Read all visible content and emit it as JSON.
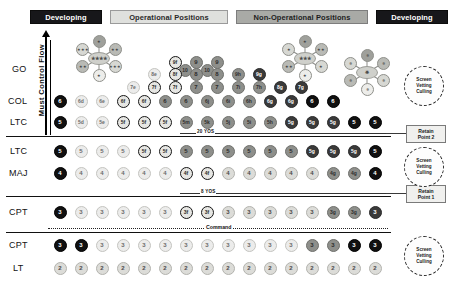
{
  "header": {
    "banners": [
      {
        "label": "Developing",
        "style": "dark"
      },
      {
        "label": "Operational Positions",
        "style": "light"
      },
      {
        "label": "Non-Operational Positions",
        "style": "mid"
      },
      {
        "label": "Developing",
        "style": "dark"
      }
    ]
  },
  "axis": {
    "label": "Must Control Flow"
  },
  "rank_labels": {
    "go": "GO",
    "col": "COL",
    "ltc_above": "LTC",
    "ltc_below": "LTC",
    "maj": "MAJ",
    "cpt_above": "CPT",
    "cpt_below": "CPT",
    "lt": "LT"
  },
  "dividers": {
    "yos20": "20 YOS",
    "yos8": "8 YOS",
    "command": "Command"
  },
  "annotations": {
    "retain_point_2": {
      "line1": "Retain",
      "line2": "Point 2"
    },
    "retain_point_1": {
      "line1": "Retain",
      "line2": "Point 1"
    },
    "screen_vetting_culling": {
      "line1": "Screen",
      "line2": "Vetting",
      "line3": "Culling"
    }
  },
  "clusters": [
    {
      "name": "four-star-cluster",
      "hub": "★★★★",
      "spokes": [
        "★",
        "★★",
        "★★★",
        "★",
        "★★",
        "★★★"
      ]
    },
    {
      "name": "three-star-cluster",
      "hub": "★★★",
      "spokes": [
        "★",
        "★★",
        "★",
        "★",
        "★★",
        "★"
      ]
    },
    {
      "name": "eagle-cluster",
      "hub": "✵",
      "spokes": [
        "✵",
        "✵",
        "✵",
        "✵",
        "✵",
        "✵"
      ]
    }
  ],
  "chart_data": {
    "type": "diagram",
    "rows": [
      {
        "rank": "GO",
        "y": 70,
        "nodes": [
          {
            "x": 185,
            "label": "10",
            "tone": "mid"
          },
          {
            "x": 207,
            "label": "10",
            "tone": "mid"
          },
          {
            "x": 175,
            "label": "9f",
            "tone": "ring",
            "y": 62
          },
          {
            "x": 196,
            "label": "9",
            "tone": "mid",
            "y": 62
          },
          {
            "x": 217,
            "label": "9",
            "tone": "mid",
            "y": 62
          },
          {
            "x": 154,
            "label": "8e",
            "tone": "vlight",
            "y": 74
          },
          {
            "x": 175,
            "label": "8f",
            "tone": "ring",
            "y": 74
          },
          {
            "x": 196,
            "label": "8",
            "tone": "mid",
            "y": 74
          },
          {
            "x": 217,
            "label": "8",
            "tone": "mid",
            "y": 74
          },
          {
            "x": 238,
            "label": "9h",
            "tone": "mid",
            "y": 74
          },
          {
            "x": 259,
            "label": "9g",
            "tone": "dark",
            "y": 74
          },
          {
            "x": 133,
            "label": "7e",
            "tone": "vlight",
            "y": 87
          },
          {
            "x": 154,
            "label": "7f",
            "tone": "ring",
            "y": 87
          },
          {
            "x": 175,
            "label": "7f",
            "tone": "ring",
            "y": 87
          },
          {
            "x": 196,
            "label": "7",
            "tone": "mid",
            "y": 87
          },
          {
            "x": 217,
            "label": "7",
            "tone": "mid",
            "y": 87
          },
          {
            "x": 238,
            "label": "7i",
            "tone": "mid",
            "y": 87
          },
          {
            "x": 259,
            "label": "7h",
            "tone": "mid",
            "y": 87
          },
          {
            "x": 280,
            "label": "8g",
            "tone": "dark",
            "y": 87
          },
          {
            "x": 301,
            "label": "7g",
            "tone": "dark",
            "y": 87
          }
        ]
      },
      {
        "rank": "COL",
        "y": 101,
        "nodes": [
          {
            "x": 60,
            "label": "6",
            "tone": "black"
          },
          {
            "x": 81,
            "label": "6d",
            "tone": "vlight"
          },
          {
            "x": 102,
            "label": "6e",
            "tone": "vlight"
          },
          {
            "x": 123,
            "label": "6f",
            "tone": "ring"
          },
          {
            "x": 144,
            "label": "6f",
            "tone": "ring"
          },
          {
            "x": 165,
            "label": "6",
            "tone": "mid"
          },
          {
            "x": 186,
            "label": "6",
            "tone": "mid"
          },
          {
            "x": 207,
            "label": "6j",
            "tone": "mid"
          },
          {
            "x": 228,
            "label": "6i",
            "tone": "mid"
          },
          {
            "x": 249,
            "label": "6h",
            "tone": "mid"
          },
          {
            "x": 270,
            "label": "6g",
            "tone": "dark"
          },
          {
            "x": 291,
            "label": "6g",
            "tone": "dark"
          },
          {
            "x": 312,
            "label": "6",
            "tone": "black"
          },
          {
            "x": 333,
            "label": "6",
            "tone": "black"
          }
        ]
      },
      {
        "rank": "LTC",
        "y": 122,
        "nodes": [
          {
            "x": 60,
            "label": "5",
            "tone": "black"
          },
          {
            "x": 81,
            "label": "5d",
            "tone": "vlight"
          },
          {
            "x": 102,
            "label": "5e",
            "tone": "vlight"
          },
          {
            "x": 123,
            "label": "5f",
            "tone": "ring"
          },
          {
            "x": 144,
            "label": "5f",
            "tone": "ring"
          },
          {
            "x": 165,
            "label": "5f",
            "tone": "ring"
          },
          {
            "x": 186,
            "label": "5m",
            "tone": "mid"
          },
          {
            "x": 207,
            "label": "5k",
            "tone": "mid"
          },
          {
            "x": 228,
            "label": "5j",
            "tone": "mid"
          },
          {
            "x": 249,
            "label": "5i",
            "tone": "mid"
          },
          {
            "x": 270,
            "label": "5h",
            "tone": "mid"
          },
          {
            "x": 291,
            "label": "5g",
            "tone": "dark"
          },
          {
            "x": 312,
            "label": "5g",
            "tone": "dark"
          },
          {
            "x": 333,
            "label": "5g",
            "tone": "dark"
          },
          {
            "x": 354,
            "label": "5",
            "tone": "black"
          },
          {
            "x": 375,
            "label": "5",
            "tone": "black"
          }
        ]
      },
      {
        "rank": "LTC",
        "y": 151,
        "nodes": [
          {
            "x": 60,
            "label": "5",
            "tone": "black"
          },
          {
            "x": 81,
            "label": "5",
            "tone": "vlight"
          },
          {
            "x": 102,
            "label": "5",
            "tone": "vlight"
          },
          {
            "x": 123,
            "label": "5",
            "tone": "vlight"
          },
          {
            "x": 144,
            "label": "5f",
            "tone": "ring"
          },
          {
            "x": 165,
            "label": "5f",
            "tone": "ring"
          },
          {
            "x": 186,
            "label": "5",
            "tone": "mid"
          },
          {
            "x": 207,
            "label": "5",
            "tone": "mid"
          },
          {
            "x": 228,
            "label": "5",
            "tone": "mid"
          },
          {
            "x": 249,
            "label": "5",
            "tone": "mid"
          },
          {
            "x": 270,
            "label": "5",
            "tone": "mid"
          },
          {
            "x": 291,
            "label": "5",
            "tone": "mid"
          },
          {
            "x": 312,
            "label": "5g",
            "tone": "dark"
          },
          {
            "x": 333,
            "label": "5g",
            "tone": "dark"
          },
          {
            "x": 354,
            "label": "5g",
            "tone": "dark"
          },
          {
            "x": 375,
            "label": "5",
            "tone": "black"
          }
        ]
      },
      {
        "rank": "MAJ",
        "y": 173,
        "nodes": [
          {
            "x": 60,
            "label": "4",
            "tone": "black"
          },
          {
            "x": 81,
            "label": "4",
            "tone": "vlight"
          },
          {
            "x": 102,
            "label": "4",
            "tone": "vlight"
          },
          {
            "x": 123,
            "label": "4",
            "tone": "vlight"
          },
          {
            "x": 144,
            "label": "4",
            "tone": "vlight"
          },
          {
            "x": 165,
            "label": "4",
            "tone": "vlight"
          },
          {
            "x": 186,
            "label": "4f",
            "tone": "ring"
          },
          {
            "x": 207,
            "label": "4f",
            "tone": "ring"
          },
          {
            "x": 228,
            "label": "4",
            "tone": "light"
          },
          {
            "x": 249,
            "label": "4",
            "tone": "light"
          },
          {
            "x": 270,
            "label": "4",
            "tone": "light"
          },
          {
            "x": 291,
            "label": "4",
            "tone": "light"
          },
          {
            "x": 312,
            "label": "4",
            "tone": "light"
          },
          {
            "x": 333,
            "label": "4g",
            "tone": "mid"
          },
          {
            "x": 354,
            "label": "4g",
            "tone": "mid"
          },
          {
            "x": 375,
            "label": "4",
            "tone": "black"
          }
        ]
      },
      {
        "rank": "CPT",
        "y": 212,
        "nodes": [
          {
            "x": 60,
            "label": "3",
            "tone": "black"
          },
          {
            "x": 81,
            "label": "3",
            "tone": "vlight"
          },
          {
            "x": 102,
            "label": "3",
            "tone": "vlight"
          },
          {
            "x": 123,
            "label": "3",
            "tone": "vlight"
          },
          {
            "x": 144,
            "label": "3",
            "tone": "vlight"
          },
          {
            "x": 165,
            "label": "3",
            "tone": "vlight"
          },
          {
            "x": 186,
            "label": "3f",
            "tone": "ring"
          },
          {
            "x": 207,
            "label": "3f",
            "tone": "ring"
          },
          {
            "x": 228,
            "label": "3",
            "tone": "light"
          },
          {
            "x": 249,
            "label": "3",
            "tone": "light"
          },
          {
            "x": 270,
            "label": "3",
            "tone": "light"
          },
          {
            "x": 291,
            "label": "3",
            "tone": "light"
          },
          {
            "x": 312,
            "label": "3",
            "tone": "light"
          },
          {
            "x": 333,
            "label": "3g",
            "tone": "mid"
          },
          {
            "x": 354,
            "label": "3g",
            "tone": "mid"
          },
          {
            "x": 375,
            "label": "3",
            "tone": "dark"
          }
        ]
      },
      {
        "rank": "CPT",
        "y": 245,
        "nodes": [
          {
            "x": 60,
            "label": "3",
            "tone": "black"
          },
          {
            "x": 81,
            "label": "3",
            "tone": "black"
          },
          {
            "x": 102,
            "label": "3",
            "tone": "vlight"
          },
          {
            "x": 123,
            "label": "3",
            "tone": "vlight"
          },
          {
            "x": 144,
            "label": "3",
            "tone": "vlight"
          },
          {
            "x": 165,
            "label": "3",
            "tone": "vlight"
          },
          {
            "x": 186,
            "label": "3",
            "tone": "vlight"
          },
          {
            "x": 207,
            "label": "3",
            "tone": "vlight"
          },
          {
            "x": 228,
            "label": "3",
            "tone": "vlight"
          },
          {
            "x": 249,
            "label": "3",
            "tone": "vlight"
          },
          {
            "x": 270,
            "label": "3",
            "tone": "vlight"
          },
          {
            "x": 291,
            "label": "3",
            "tone": "vlight"
          },
          {
            "x": 312,
            "label": "3",
            "tone": "mid"
          },
          {
            "x": 333,
            "label": "3",
            "tone": "mid"
          },
          {
            "x": 354,
            "label": "3",
            "tone": "black"
          },
          {
            "x": 375,
            "label": "3",
            "tone": "black"
          }
        ]
      },
      {
        "rank": "LT",
        "y": 268,
        "nodes": [
          {
            "x": 60,
            "label": "2",
            "tone": "light"
          },
          {
            "x": 81,
            "label": "2",
            "tone": "light"
          },
          {
            "x": 102,
            "label": "2",
            "tone": "light"
          },
          {
            "x": 123,
            "label": "2",
            "tone": "light"
          },
          {
            "x": 144,
            "label": "2",
            "tone": "light"
          },
          {
            "x": 165,
            "label": "2",
            "tone": "light"
          },
          {
            "x": 186,
            "label": "2",
            "tone": "light"
          },
          {
            "x": 207,
            "label": "2",
            "tone": "light"
          },
          {
            "x": 228,
            "label": "2",
            "tone": "light"
          },
          {
            "x": 249,
            "label": "2",
            "tone": "light"
          },
          {
            "x": 270,
            "label": "2",
            "tone": "light"
          },
          {
            "x": 291,
            "label": "2",
            "tone": "light"
          },
          {
            "x": 312,
            "label": "2",
            "tone": "light"
          },
          {
            "x": 333,
            "label": "2",
            "tone": "light"
          },
          {
            "x": 354,
            "label": "2",
            "tone": "light"
          },
          {
            "x": 375,
            "label": "2",
            "tone": "light"
          }
        ]
      }
    ],
    "colors": {
      "black": "#101010",
      "dark": "#3a3a3a",
      "mid": "#8e8f8b",
      "light": "#dcdcd8",
      "vlight": "#ececeb",
      "ring": "#e6e6e3"
    }
  }
}
